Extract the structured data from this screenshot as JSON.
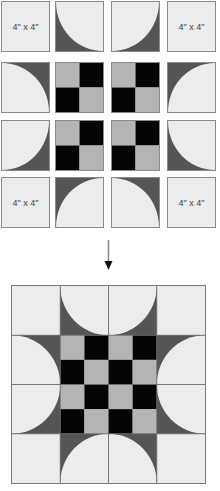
{
  "colors": {
    "light": "#ececec",
    "dark": "#555555",
    "gray": "#b4b4b4",
    "black": "#050505",
    "border": "#8a8a8a"
  },
  "top_grid": {
    "rows": [
      [
        {
          "type": "label",
          "text": "4\" x 4\""
        },
        {
          "type": "curve",
          "arc_center": "top-right"
        },
        {
          "type": "curve",
          "arc_center": "top-left"
        },
        {
          "type": "label",
          "text": "4\" x 4\""
        }
      ],
      [
        {
          "type": "curve",
          "arc_center": "bottom-left"
        },
        {
          "type": "checker"
        },
        {
          "type": "checker"
        },
        {
          "type": "curve",
          "arc_center": "bottom-right"
        }
      ],
      [
        {
          "type": "curve",
          "arc_center": "top-left"
        },
        {
          "type": "checker"
        },
        {
          "type": "checker"
        },
        {
          "type": "curve",
          "arc_center": "top-right"
        }
      ],
      [
        {
          "type": "label",
          "text": "4\" x 4\""
        },
        {
          "type": "curve",
          "arc_center": "bottom-right"
        },
        {
          "type": "curve",
          "arc_center": "bottom-left"
        },
        {
          "type": "label",
          "text": "4\" x 4\""
        }
      ]
    ]
  },
  "labels": {
    "r0c0": "4\" x 4\"",
    "r0c3": "4\" x 4\"",
    "r3c0": "4\" x 4\"",
    "r3c3": "4\" x 4\""
  },
  "arrow": {
    "direction": "down"
  },
  "assembled_block": {
    "grid": "4x4",
    "center": "4x4 checkerboard, gray top-left"
  }
}
